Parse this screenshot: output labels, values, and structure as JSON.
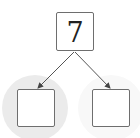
{
  "diagram": {
    "type": "number-bond",
    "root": {
      "value": "7"
    },
    "children": [
      {
        "position": "left",
        "value": "",
        "highlighted": true
      },
      {
        "position": "right",
        "value": "",
        "highlighted": false
      }
    ],
    "colors": {
      "box_border": "#6e6e6e",
      "arrow": "#555555",
      "highlight_left": "#ebebeb",
      "highlight_right": "#f8f8f8",
      "text": "#222222"
    }
  }
}
